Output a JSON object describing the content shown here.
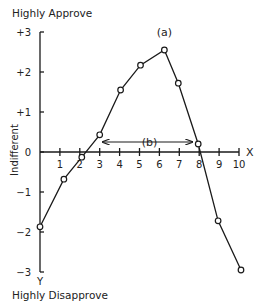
{
  "chart_data": {
    "type": "line",
    "title": "",
    "top_label": "Highly Approve",
    "bottom_label": "Highly Disapprove",
    "xlabel": "X",
    "ylabel": "Y",
    "y_mid_label": "Indifferent",
    "xlim": [
      0,
      10
    ],
    "ylim": [
      -3,
      3
    ],
    "x_ticks": [
      1,
      2,
      3,
      4,
      5,
      6,
      7,
      8,
      9,
      10
    ],
    "y_ticks": [
      "+3",
      "+2",
      "+1",
      "0",
      "−1",
      "−2",
      "−3"
    ],
    "y_tick_values": [
      3,
      2,
      1,
      0,
      -1,
      -2,
      -3
    ],
    "grid": false,
    "legend": null,
    "series": [
      {
        "name": "approval curve",
        "x": [
          0,
          1.2,
          2.1,
          3.0,
          4.05,
          5.05,
          6.25,
          6.95,
          7.95,
          8.95,
          10.1
        ],
        "y": [
          -1.87,
          -0.68,
          -0.13,
          0.43,
          1.55,
          2.17,
          2.55,
          1.72,
          0.2,
          -1.72,
          -2.95
        ]
      }
    ],
    "annotations": [
      {
        "text": "(a)",
        "x": 6.25,
        "y": 2.9,
        "note": "peak of curve"
      },
      {
        "text": "(b)",
        "x": 5.5,
        "y": 0.5,
        "note": "double-headed arrow spanning x≈3.1 to x≈7.7 above the axis"
      }
    ],
    "range_arrow": {
      "x_start": 3.15,
      "x_end": 7.65,
      "y": 0.25
    }
  }
}
